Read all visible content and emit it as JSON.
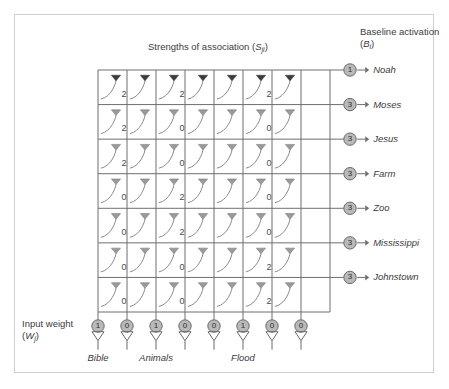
{
  "figure": {
    "headings": {
      "assoc_title": "Strengths of association (",
      "assoc_symbol": "S",
      "assoc_sub": "ji",
      "assoc_close": ")",
      "baseline_title": "Baseline activation",
      "baseline_symbol": "B",
      "baseline_sub": "i",
      "input_title": "Input weight",
      "input_symbol": "W",
      "input_sub": "j"
    },
    "rows": [
      {
        "name": "Noah",
        "baseline": "1"
      },
      {
        "name": "Moses",
        "baseline": "3"
      },
      {
        "name": "Jesus",
        "baseline": "3"
      },
      {
        "name": "Farm",
        "baseline": "3"
      },
      {
        "name": "Zoo",
        "baseline": "3"
      },
      {
        "name": "Mississippi",
        "baseline": "3"
      },
      {
        "name": "Johnstown",
        "baseline": "3"
      }
    ],
    "columns": [
      {
        "name": "Bible",
        "weight": "1"
      },
      {
        "name": "",
        "weight": "0"
      },
      {
        "name": "Animals",
        "weight": "1"
      },
      {
        "name": "",
        "weight": "0"
      },
      {
        "name": "",
        "weight": "0"
      },
      {
        "name": "Flood",
        "weight": "1"
      },
      {
        "name": "",
        "weight": "0"
      },
      {
        "name": "",
        "weight": "0"
      }
    ],
    "association_matrix": [
      [
        "2",
        "",
        "2",
        "",
        "",
        "2",
        ""
      ],
      [
        "2",
        "",
        "0",
        "",
        "",
        "0",
        ""
      ],
      [
        "2",
        "",
        "0",
        "",
        "",
        "0",
        ""
      ],
      [
        "0",
        "",
        "2",
        "",
        "",
        "0",
        ""
      ],
      [
        "0",
        "",
        "2",
        "",
        "",
        "0",
        ""
      ],
      [
        "0",
        "",
        "0",
        "",
        "",
        "2",
        ""
      ],
      [
        "0",
        "",
        "0",
        "",
        "",
        "2",
        ""
      ]
    ],
    "colors": {
      "frame": "#cfcfcf",
      "grid_line": "#6e6e6e",
      "node_fill": "#b9b9b9",
      "node_stroke": "#6a6a6a",
      "arrow_dark": "#3a3a3a",
      "arrow_light": "#9a9a9a",
      "curve": "#8a8a8a",
      "text": "#3b3b3b",
      "background": "#ffffff"
    },
    "geometry": {
      "grid_left": 98,
      "grid_right": 330,
      "grid_top": 70,
      "grid_bottom": 312,
      "col_count": 8,
      "row_count": 7
    }
  }
}
